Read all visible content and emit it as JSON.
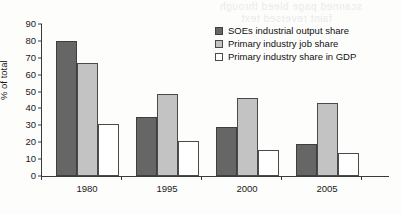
{
  "chart_data": {
    "type": "bar",
    "title": "",
    "subtitle": "",
    "xlabel": "",
    "ylabel": "% of total",
    "categories": [
      "1980",
      "1995",
      "2000",
      "2005"
    ],
    "series": [
      {
        "name": "SOEs industrial output share",
        "values": [
          80,
          35,
          29,
          19
        ],
        "color": "#666666"
      },
      {
        "name": "Primary industry job share",
        "values": [
          67,
          48.5,
          46,
          43
        ],
        "color": "#c3c3c3"
      },
      {
        "name": "Primary industry share in GDP",
        "values": [
          31,
          20.5,
          15.5,
          13.5
        ],
        "color": "#ffffff"
      }
    ],
    "ylim": [
      0,
      90
    ],
    "ytick_values": [
      0,
      10,
      20,
      30,
      40,
      50,
      60,
      70,
      80,
      90
    ],
    "ytick_labels": [
      "0",
      "10",
      "20",
      "30",
      "40",
      "50",
      "60",
      "70",
      "80",
      "90"
    ],
    "grid": false,
    "legend_position": "upper right",
    "legend_entries": [
      "SOEs industrial output share",
      "Primary industry job share",
      "Primary industry share in GDP"
    ]
  },
  "background_artifact": {
    "line1": "scanned page bleed through",
    "line2": "faint reversed text"
  }
}
